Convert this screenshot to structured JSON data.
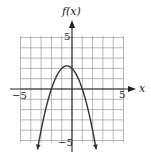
{
  "chart_data": {
    "type": "line",
    "title": "",
    "xlabel": "x",
    "ylabel": "f(x)",
    "xlim": [
      -5,
      5
    ],
    "ylim": [
      -5,
      5
    ],
    "grid": true,
    "grid_step": 1,
    "x_tick_labels": [
      "-5",
      "5"
    ],
    "y_tick_labels": [
      "5",
      "-5"
    ],
    "series": [
      {
        "name": "f(x)",
        "description": "downward-opening parabola, arrows at both ends",
        "vertex": [
          -0.5,
          2.25
        ],
        "x_intercepts": [
          -2,
          1
        ],
        "x": [
          -3.35,
          -3,
          -2.5,
          -2,
          -1.5,
          -1,
          -0.5,
          0,
          0.5,
          1,
          1.5,
          2,
          2.35
        ],
        "y": [
          -5.87,
          -4,
          -1.75,
          0,
          1.25,
          2,
          2.25,
          2,
          1.25,
          0,
          -1.75,
          -4,
          -5.87
        ]
      }
    ]
  },
  "labels": {
    "y_axis": "f(x)",
    "x_axis": "x",
    "x_min": "−5",
    "x_max": "5",
    "y_max": "5",
    "y_min": "−5"
  },
  "colors": {
    "grid": "#9a9a9a",
    "axis": "#222222",
    "curve": "#333333"
  }
}
